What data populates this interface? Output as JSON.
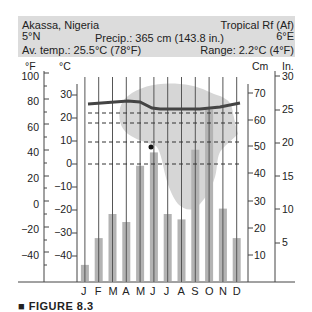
{
  "header": {
    "location": "Akassa, Nigeria",
    "climate_type": "Tropical Rf (Af)",
    "latitude": "5°N",
    "longitude": "6°E",
    "precip": "Precip.: 365 cm (143.8 in.)",
    "avg_temp": "Av. temp.: 25.5°C (78°F)",
    "range": "Range: 2.2°C (4°F)"
  },
  "axes": {
    "f_label": "°F",
    "c_label": "°C",
    "cm_label": "Cm",
    "in_label": "In.",
    "f_ticks": [
      "100",
      "80",
      "60",
      "40",
      "20",
      "0",
      "−20",
      "−40"
    ],
    "c_ticks": [
      "30",
      "20",
      "10",
      "0",
      "−10",
      "−20",
      "−30",
      "−40"
    ],
    "cm_ticks": [
      "70",
      "60",
      "50",
      "40",
      "30",
      "20",
      "10"
    ],
    "in_ticks": [
      "30",
      "25",
      "20",
      "15",
      "10",
      "5"
    ]
  },
  "months": [
    "J",
    "F",
    "M",
    "A",
    "M",
    "J",
    "J",
    "A",
    "S",
    "O",
    "N",
    "D"
  ],
  "figure_caption": "■ FIGURE 8.3",
  "colors": {
    "header_bg": "#dcdcdc",
    "bar": "#b3b3b3",
    "map": "#d6d6d6",
    "temp_line": "#444444",
    "grid": "#555555"
  },
  "chart_data": {
    "type": "bar+line",
    "categories": [
      "J",
      "F",
      "M",
      "A",
      "M",
      "J",
      "J",
      "A",
      "S",
      "O",
      "N",
      "D"
    ],
    "series": [
      {
        "name": "Precipitation (cm)",
        "type": "bar",
        "axis": "right (Cm)",
        "values": [
          6,
          16,
          25,
          22,
          43,
          48,
          25,
          23,
          49,
          64,
          27,
          16
        ]
      },
      {
        "name": "Temperature (°C)",
        "type": "line",
        "axis": "left (°C)",
        "values": [
          26.5,
          26.8,
          27.0,
          27.2,
          26.0,
          25.5,
          25.4,
          25.4,
          25.5,
          25.8,
          26.2,
          26.6
        ]
      }
    ],
    "left_axis_c": {
      "label": "°C",
      "range": [
        -50,
        35
      ],
      "ticks": [
        30,
        20,
        10,
        0,
        -10,
        -20,
        -30,
        -40
      ]
    },
    "left_axis_f": {
      "label": "°F",
      "range": [
        -60,
        100
      ],
      "ticks": [
        100,
        80,
        60,
        40,
        20,
        0,
        -20,
        -40
      ]
    },
    "right_axis_cm": {
      "label": "Cm",
      "range": [
        0,
        78
      ],
      "ticks": [
        10,
        20,
        30,
        40,
        50,
        60,
        70
      ]
    },
    "right_axis_in": {
      "label": "In.",
      "range": [
        0,
        30
      ],
      "ticks": [
        5,
        10,
        15,
        20,
        25,
        30
      ]
    },
    "reference_lines_c": [
      22,
      18,
      10,
      0
    ],
    "annotations": [
      "Precip.: 365 cm (143.8 in.)",
      "Av. temp.: 25.5°C (78°F)",
      "Range: 2.2°C (4°F)",
      "5°N",
      "6°E"
    ],
    "inset": "Map of Africa with station location dot"
  }
}
